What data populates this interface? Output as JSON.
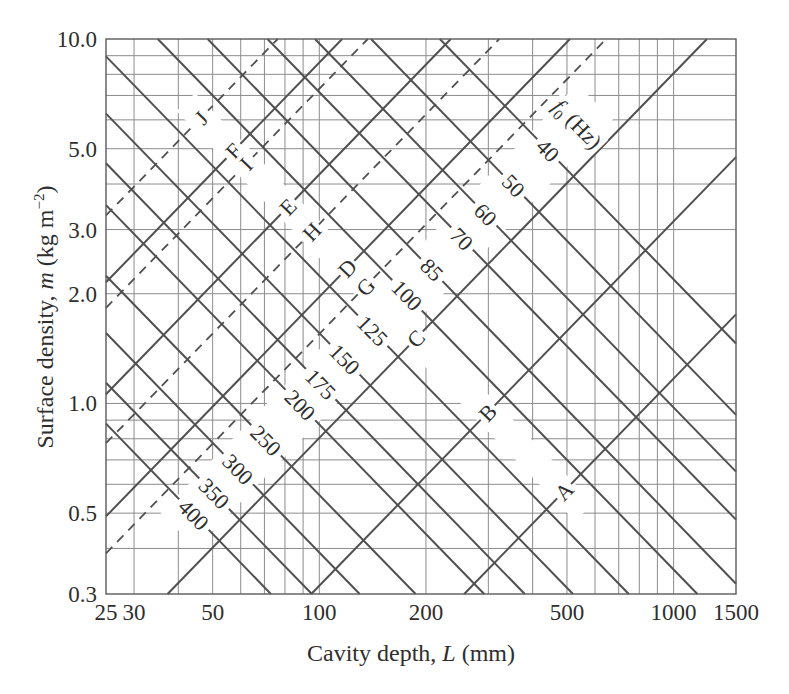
{
  "chart_data": {
    "type": "line",
    "title": "",
    "xlabel": "Cavity depth, L (mm)",
    "ylabel": "Surface density, m (kg m^-2)",
    "xlabel_parts": {
      "prefix": "Cavity depth, ",
      "variable": "L",
      "unit": " (mm)"
    },
    "ylabel_parts": {
      "prefix": "Surface density, ",
      "variable": "m",
      "unit_open": " (kg m",
      "unit_exp": "−2",
      "unit_close": ")"
    },
    "xscale": "log",
    "yscale": "log",
    "xlim": [
      25,
      1500
    ],
    "ylim": [
      0.3,
      10
    ],
    "xticks": [
      25,
      30,
      50,
      100,
      200,
      500,
      1000,
      1500
    ],
    "xtick_labels": [
      "25",
      "30",
      "50",
      "100",
      "200",
      "500",
      "1000",
      "1500"
    ],
    "yticks": [
      0.3,
      0.5,
      1.0,
      2.0,
      3.0,
      5.0,
      10.0
    ],
    "ytick_labels": [
      "0.3",
      "0.5",
      "1.0",
      "2.0",
      "3.0",
      "5.0",
      "10.0"
    ],
    "grid": true,
    "x_gridlines": [
      30,
      40,
      50,
      60,
      70,
      80,
      90,
      100,
      200,
      300,
      400,
      500,
      600,
      700,
      800,
      900,
      1000
    ],
    "y_gridlines": [
      0.4,
      0.5,
      0.6,
      0.7,
      0.8,
      0.9,
      1,
      2,
      3,
      4,
      5,
      6,
      7,
      8,
      9
    ],
    "legend": "none (lines labelled inline)",
    "resonance_frequency_lines": {
      "annotation": "f0 (Hz)",
      "annotation_parts": {
        "symbol": "f",
        "subscript": "0",
        "unit": " (Hz)"
      },
      "annotation_position": [
        535,
        5.85
      ],
      "relation": "m x L approx 3.5e6 / f0^2 (m in kg m^-2, L in mm)",
      "style": "solid",
      "label_band_m_over_L": 0.0112,
      "label_band_L_range": [
        40,
        600
      ],
      "series": [
        {
          "label": "40",
          "f0": 40,
          "mL": 2188,
          "points": [
            [
              218.8,
              10
            ],
            [
              1500,
              1.46
            ]
          ]
        },
        {
          "label": "50",
          "f0": 50,
          "mL": 1400,
          "points": [
            [
              140,
              10
            ],
            [
              1500,
              0.93
            ]
          ]
        },
        {
          "label": "60",
          "f0": 60,
          "mL": 972,
          "points": [
            [
              97.2,
              10
            ],
            [
              1500,
              0.65
            ]
          ]
        },
        {
          "label": "70",
          "f0": 70,
          "mL": 714,
          "points": [
            [
              71.4,
              10
            ],
            [
              1500,
              0.48
            ]
          ]
        },
        {
          "label": "85",
          "f0": 85,
          "mL": 484,
          "points": [
            [
              48.4,
              10
            ],
            [
              1500,
              0.32
            ]
          ]
        },
        {
          "label": "100",
          "f0": 100,
          "mL": 350,
          "points": [
            [
              35,
              10
            ],
            [
              1167,
              0.3
            ]
          ]
        },
        {
          "label": "125",
          "f0": 125,
          "mL": 224,
          "points": [
            [
              25,
              8.96
            ],
            [
              747,
              0.3
            ]
          ]
        },
        {
          "label": "150",
          "f0": 150,
          "mL": 156,
          "points": [
            [
              25,
              6.24
            ],
            [
              520,
              0.3
            ]
          ]
        },
        {
          "label": "175",
          "f0": 175,
          "mL": 114,
          "points": [
            [
              25,
              4.56
            ],
            [
              380,
              0.3
            ]
          ]
        },
        {
          "label": "200",
          "f0": 200,
          "mL": 87.5,
          "points": [
            [
              25,
              3.5
            ],
            [
              292,
              0.3
            ]
          ]
        },
        {
          "label": "250",
          "f0": 250,
          "mL": 56,
          "points": [
            [
              25,
              2.24
            ],
            [
              187,
              0.3
            ]
          ]
        },
        {
          "label": "300",
          "f0": 300,
          "mL": 38.9,
          "points": [
            [
              25,
              1.56
            ],
            [
              130,
              0.3
            ]
          ]
        },
        {
          "label": "350",
          "f0": 350,
          "mL": 28.6,
          "points": [
            [
              25,
              1.14
            ],
            [
              95.3,
              0.3
            ]
          ]
        },
        {
          "label": "400",
          "f0": 400,
          "mL": 21.9,
          "points": [
            [
              25,
              0.88
            ],
            [
              73,
              0.3
            ]
          ]
        }
      ]
    },
    "panel_lines": {
      "label_band_mL": 282,
      "label_band_L_range": [
        42,
        560
      ],
      "series": [
        {
          "name": "A",
          "style": "solid",
          "m_over_L": 0.00117,
          "points": [
            [
              256.4,
              0.3
            ],
            [
              1500,
              1.755
            ]
          ]
        },
        {
          "name": "B",
          "style": "solid",
          "m_over_L": 0.00316,
          "points": [
            [
              94.9,
              0.3
            ],
            [
              1500,
              4.74
            ]
          ]
        },
        {
          "name": "C",
          "style": "solid",
          "m_over_L": 0.00805,
          "points": [
            [
              37.3,
              0.3
            ],
            [
              1242,
              10
            ]
          ]
        },
        {
          "name": "D",
          "style": "solid",
          "m_over_L": 0.0196,
          "points": [
            [
              25,
              0.49
            ],
            [
              510,
              10
            ]
          ]
        },
        {
          "name": "E",
          "style": "solid",
          "m_over_L": 0.0425,
          "points": [
            [
              25,
              1.06
            ],
            [
              235,
              10
            ]
          ]
        },
        {
          "name": "F",
          "style": "solid",
          "m_over_L": 0.086,
          "points": [
            [
              25,
              2.15
            ],
            [
              116,
              10
            ]
          ]
        },
        {
          "name": "G",
          "style": "dashed",
          "m_over_L": 0.0155,
          "points": [
            [
              25,
              0.388
            ],
            [
              645,
              10
            ]
          ]
        },
        {
          "name": "H",
          "style": "dashed",
          "m_over_L": 0.0311,
          "points": [
            [
              25,
              0.778
            ],
            [
              322,
              10
            ]
          ]
        },
        {
          "name": "I",
          "style": "dashed",
          "m_over_L": 0.073,
          "points": [
            [
              25,
              1.83
            ],
            [
              137,
              10
            ]
          ]
        },
        {
          "name": "J",
          "style": "dashed",
          "m_over_L": 0.131,
          "points": [
            [
              25,
              3.28
            ],
            [
              76.3,
              10
            ]
          ]
        }
      ]
    },
    "colors": {
      "lines": "#505050",
      "grid": "#8c8c8c",
      "text": "#2e2e2e",
      "background": "#ffffff"
    }
  }
}
